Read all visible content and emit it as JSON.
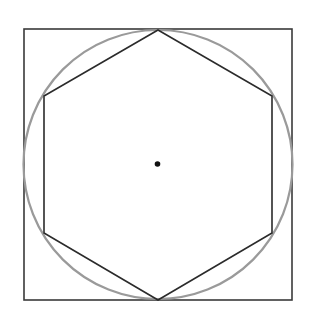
{
  "figure": {
    "canvas": {
      "width": 316,
      "height": 327,
      "background_color": "#ffffff"
    },
    "shapes": {
      "square": {
        "label": "bounding-square",
        "x": 24,
        "y": 29,
        "width": 268,
        "height": 271,
        "stroke_color": "#3a3a3a",
        "stroke_width": 1.6,
        "fill": "none"
      },
      "circle": {
        "label": "circumscribed-circle",
        "center_x": 158,
        "center_y": 164.5,
        "radius": 134.5,
        "stroke_color": "#9a9a9a",
        "stroke_width": 2.2,
        "fill": "none"
      },
      "hexagon": {
        "label": "regular-hexagon",
        "orientation": "pointy-top",
        "sides": 6,
        "center_x": 158,
        "center_y": 164.5,
        "circumradius": 134.5,
        "stroke_color": "#2b2b2b",
        "stroke_width": 1.6,
        "fill": "none",
        "points": "158,30 272,96 272,233 158,300 44,233 44,96",
        "vertices": [
          {
            "name": "top",
            "x": 158,
            "y": 30
          },
          {
            "name": "upper-right",
            "x": 272,
            "y": 96
          },
          {
            "name": "lower-right",
            "x": 272,
            "y": 233
          },
          {
            "name": "bottom",
            "x": 158,
            "y": 300
          },
          {
            "name": "lower-left",
            "x": 44,
            "y": 233
          },
          {
            "name": "upper-left",
            "x": 44,
            "y": 96
          }
        ]
      },
      "center_dot": {
        "label": "center-point",
        "center_x": 157.5,
        "center_y": 164,
        "radius": 2.8,
        "fill_color": "#111111"
      }
    }
  }
}
